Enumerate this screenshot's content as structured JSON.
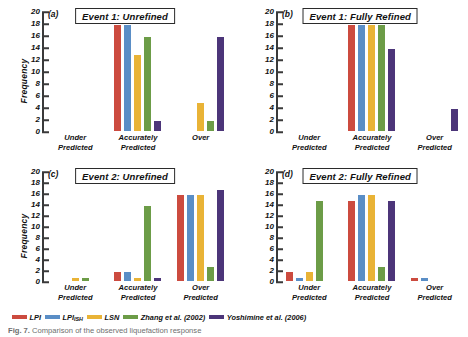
{
  "figure": {
    "caption_label": "Fig. 7.",
    "caption_text": "Comparison of the observed liquefaction response"
  },
  "legend": {
    "position": "bottom-left",
    "items": [
      {
        "label": "LPI",
        "sub": "",
        "color": "#cc4b3f"
      },
      {
        "label": "LPI",
        "sub": "ISH",
        "color": "#5a8ec6"
      },
      {
        "label": "LSN",
        "sub": "",
        "color": "#e9b336"
      },
      {
        "label": "Zhang et al. (2002)",
        "sub": "",
        "color": "#6c9c47"
      },
      {
        "label": "Yoshimine et al. (2006)",
        "sub": "",
        "color": "#4c3579"
      }
    ]
  },
  "axis": {
    "ylabel": "Frequency",
    "yticks": [
      0,
      2,
      4,
      6,
      8,
      10,
      12,
      14,
      16,
      18,
      20
    ],
    "ylim": [
      0,
      20
    ]
  },
  "chart_data": [
    {
      "type": "bar",
      "panel": "a",
      "panel_letter": "(a)",
      "title": "Event 1: Unrefined",
      "ylabel": "Frequency",
      "xlabel": "",
      "ylim": [
        0,
        20
      ],
      "grid": false,
      "categories": [
        "Under Predicted",
        "Accurately Predicted",
        "Over"
      ],
      "category_lines": [
        [
          "Under",
          "Predicted"
        ],
        [
          "Accurately",
          "Predicted"
        ],
        [
          "Over",
          ""
        ]
      ],
      "series": [
        {
          "name": "LPI",
          "color": "#cc4b3f",
          "values": [
            0,
            18,
            0
          ]
        },
        {
          "name": "LPI_ISH",
          "color": "#5a8ec6",
          "values": [
            0,
            18,
            0
          ]
        },
        {
          "name": "LSN",
          "color": "#e9b336",
          "values": [
            0,
            13,
            5
          ]
        },
        {
          "name": "Zhang et al. (2002)",
          "color": "#6c9c47",
          "values": [
            0,
            16,
            2
          ]
        },
        {
          "name": "Yoshimine et al. (2006)",
          "color": "#4c3579",
          "values": [
            0,
            2,
            16
          ]
        }
      ]
    },
    {
      "type": "bar",
      "panel": "b",
      "panel_letter": "(b)",
      "title": "Event 1: Fully Refined",
      "ylabel": "",
      "xlabel": "",
      "ylim": [
        0,
        20
      ],
      "grid": false,
      "categories": [
        "Under Predicted",
        "Accurately Predicted",
        "Over Predicted"
      ],
      "category_lines": [
        [
          "Under",
          "Predicted"
        ],
        [
          "Accurately",
          "Predicted"
        ],
        [
          "Over",
          "Predicted"
        ]
      ],
      "series": [
        {
          "name": "LPI",
          "color": "#cc4b3f",
          "values": [
            0,
            18,
            0
          ]
        },
        {
          "name": "LPI_ISH",
          "color": "#5a8ec6",
          "values": [
            0,
            18,
            0
          ]
        },
        {
          "name": "LSN",
          "color": "#e9b336",
          "values": [
            0,
            18,
            0
          ]
        },
        {
          "name": "Zhang et al. (2002)",
          "color": "#6c9c47",
          "values": [
            0,
            18,
            0
          ]
        },
        {
          "name": "Yoshimine et al. (2006)",
          "color": "#4c3579",
          "values": [
            0,
            14,
            4
          ]
        }
      ]
    },
    {
      "type": "bar",
      "panel": "c",
      "panel_letter": "(c)",
      "title": "Event 2: Unrefined",
      "ylabel": "Frequency",
      "xlabel": "",
      "ylim": [
        0,
        20
      ],
      "grid": false,
      "categories": [
        "Under Predicted",
        "Accurately Predicted",
        "Over Predicted"
      ],
      "category_lines": [
        [
          "Under",
          "Predicted"
        ],
        [
          "Accurately",
          "Predicted"
        ],
        [
          "Over",
          "Predicted"
        ]
      ],
      "series": [
        {
          "name": "LPI",
          "color": "#cc4b3f",
          "values": [
            0,
            2,
            16
          ]
        },
        {
          "name": "LPI_ISH",
          "color": "#5a8ec6",
          "values": [
            0,
            2,
            16
          ]
        },
        {
          "name": "LSN",
          "color": "#e9b336",
          "values": [
            1,
            1,
            16
          ]
        },
        {
          "name": "Zhang et al. (2002)",
          "color": "#6c9c47",
          "values": [
            1,
            14,
            3
          ]
        },
        {
          "name": "Yoshimine et al. (2006)",
          "color": "#4c3579",
          "values": [
            0,
            1,
            17
          ]
        }
      ]
    },
    {
      "type": "bar",
      "panel": "d",
      "panel_letter": "(d)",
      "title": "Event 2: Fully Refined",
      "ylabel": "",
      "xlabel": "",
      "ylim": [
        0,
        20
      ],
      "grid": false,
      "categories": [
        "Under Predicted",
        "Accurately Predicted",
        "Over Predicted"
      ],
      "category_lines": [
        [
          "Under",
          "Predicted"
        ],
        [
          "Accurately",
          "Predicted"
        ],
        [
          "Over",
          "Predicted"
        ]
      ],
      "series": [
        {
          "name": "LPI",
          "color": "#cc4b3f",
          "values": [
            2,
            15,
            1
          ]
        },
        {
          "name": "LPI_ISH",
          "color": "#5a8ec6",
          "values": [
            1,
            16,
            1
          ]
        },
        {
          "name": "LSN",
          "color": "#e9b336",
          "values": [
            2,
            16,
            0
          ]
        },
        {
          "name": "Zhang et al. (2002)",
          "color": "#6c9c47",
          "values": [
            15,
            3,
            0
          ]
        },
        {
          "name": "Yoshimine et al. (2006)",
          "color": "#4c3579",
          "values": [
            0,
            15,
            0
          ]
        }
      ]
    }
  ]
}
